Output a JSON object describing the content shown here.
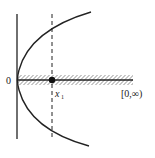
{
  "diagram": {
    "labels": {
      "origin": "0",
      "point": "x",
      "point_subscript": "1",
      "interval": "[0,∞)"
    },
    "colors": {
      "ink": "#222222",
      "background": "#ffffff"
    },
    "elements": [
      "vertical axis line",
      "horizontal hatched half-line [0,∞)",
      "parabola opening rightward with vertex at origin",
      "dashed vertical line through x1",
      "filled point at x1 on half-line"
    ]
  }
}
